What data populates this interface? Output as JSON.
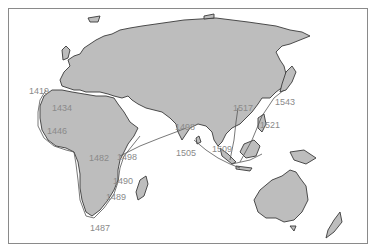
{
  "map": {
    "type": "historical exploration routes",
    "colors": {
      "land": "#bdbdbd",
      "coastline": "#3a3a3a",
      "sea": "#ffffff",
      "route": "#555555",
      "label": "#8a8a8a",
      "frame": "#8a8a8a"
    },
    "labels": [
      {
        "id": "y1419",
        "text": "1419",
        "x": 29,
        "y": 87
      },
      {
        "id": "y1434",
        "text": "1434",
        "x": 52,
        "y": 104
      },
      {
        "id": "y1446",
        "text": "1446",
        "x": 47,
        "y": 127
      },
      {
        "id": "y1482",
        "text": "1482",
        "x": 89,
        "y": 154
      },
      {
        "id": "y1498a",
        "text": "1498",
        "x": 117,
        "y": 153
      },
      {
        "id": "y1490",
        "text": "1490",
        "x": 113,
        "y": 177
      },
      {
        "id": "y1489",
        "text": "1489",
        "x": 106,
        "y": 193
      },
      {
        "id": "y1487",
        "text": "1487",
        "x": 90,
        "y": 224
      },
      {
        "id": "y1498b",
        "text": "1498",
        "x": 175,
        "y": 123
      },
      {
        "id": "y1505",
        "text": "1505",
        "x": 176,
        "y": 149
      },
      {
        "id": "y1509",
        "text": "1509",
        "x": 212,
        "y": 145
      },
      {
        "id": "y1517",
        "text": "1517",
        "x": 233,
        "y": 104
      },
      {
        "id": "y1521",
        "text": "1521",
        "x": 260,
        "y": 121
      },
      {
        "id": "y1543",
        "text": "1543",
        "x": 275,
        "y": 98
      }
    ]
  }
}
